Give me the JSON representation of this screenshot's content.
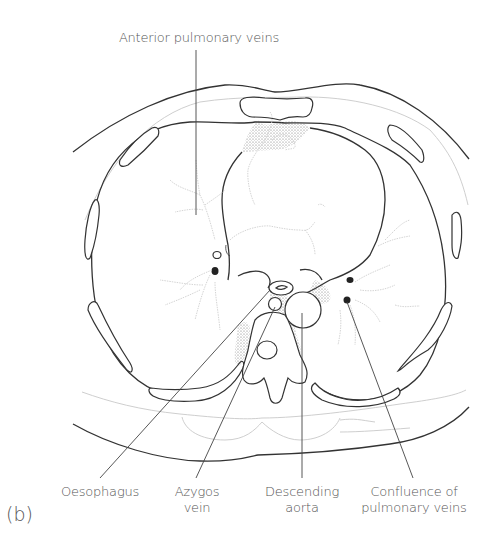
{
  "figure": {
    "panel_label": "(b)",
    "labels": {
      "top": "Anterior pulmonary veins",
      "bottom": [
        {
          "id": "oesophagus",
          "line1": "Oesophagus",
          "line2": ""
        },
        {
          "id": "azygos-vein",
          "line1": "Azygos",
          "line2": "vein"
        },
        {
          "id": "descending-aorta",
          "line1": "Descending",
          "line2": "aorta"
        },
        {
          "id": "confluence",
          "line1": "Confluence of",
          "line2": "pulmonary veins"
        }
      ]
    },
    "colors": {
      "outline": "#333333",
      "faint": "#c8c8c8",
      "text": "#555555",
      "background": "#ffffff"
    }
  }
}
